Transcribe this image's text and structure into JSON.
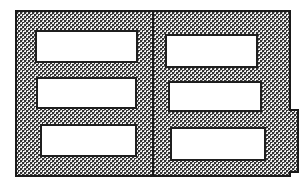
{
  "figure": {
    "type": "technical-cross-section",
    "title": "Hatched cross-section diagram",
    "description": "Rectangular hatched body divided by a vertical center line into two panels, each containing three white rectangular voids, with a small tab protruding from the right edge.",
    "canvas": {
      "width": 308,
      "height": 189,
      "background": "#ffffff"
    },
    "colors": {
      "outline": "#1a1a1a",
      "hatch_dark": "#3a3a3a",
      "hatch_light": "#e8e8e8",
      "void_fill": "#ffffff",
      "void_stroke": "#1f1f1f",
      "divider": "#1a1a1a"
    },
    "body": {
      "name": "hatched-body",
      "x": 16,
      "y": 11,
      "width": 274,
      "height": 165,
      "fill": "checkered-hatch",
      "stroke_width": 1.4
    },
    "divider": {
      "name": "center-divider",
      "x": 153,
      "y_top": 11,
      "y_bottom": 176,
      "stroke_width": 1.2
    },
    "tab": {
      "name": "right-edge-tab",
      "x": 290,
      "y": 110,
      "width": 8,
      "height": 62,
      "fill": "checkered-hatch"
    },
    "voids": [
      {
        "name": "void-left-1",
        "column": "left",
        "index": 1,
        "x": 36,
        "y": 31,
        "width": 101,
        "height": 31
      },
      {
        "name": "void-left-2",
        "column": "left",
        "index": 2,
        "x": 37,
        "y": 78,
        "width": 99,
        "height": 30
      },
      {
        "name": "void-left-3",
        "column": "left",
        "index": 3,
        "x": 41,
        "y": 125,
        "width": 95,
        "height": 31
      },
      {
        "name": "void-right-1",
        "column": "right",
        "index": 1,
        "x": 166,
        "y": 35,
        "width": 91,
        "height": 32
      },
      {
        "name": "void-right-2",
        "column": "right",
        "index": 2,
        "x": 169,
        "y": 82,
        "width": 92,
        "height": 29
      },
      {
        "name": "void-right-3",
        "column": "right",
        "index": 3,
        "x": 171,
        "y": 128,
        "width": 94,
        "height": 32
      }
    ],
    "labels": {
      "body": "Hatched body",
      "divider": "Center divider line",
      "tab": "Right edge tab",
      "left_column": "Left panel",
      "right_column": "Right panel",
      "void_left_1": "Left void 1",
      "void_left_2": "Left void 2",
      "void_left_3": "Left void 3",
      "void_right_1": "Right void 1",
      "void_right_2": "Right void 2",
      "void_right_3": "Right void 3"
    }
  }
}
